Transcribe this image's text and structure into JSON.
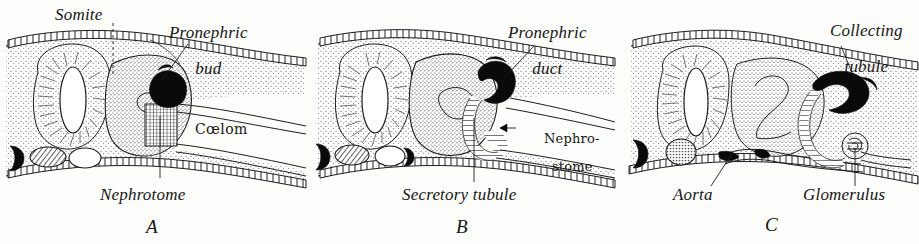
{
  "figure": {
    "background_color": "#fdfdfb",
    "ink_color": "#1a1a1a",
    "style": "engraved line drawing with stipple shading"
  },
  "panels": [
    {
      "plate": "A",
      "stage_name": "Pronephric bud stage",
      "labels": [
        {
          "id": "somite",
          "text": "Somite",
          "style": "italic",
          "lines": 1
        },
        {
          "id": "pronephric-bud",
          "text": "Pronephric",
          "text2": "bud",
          "style": "italic",
          "lines": 2
        },
        {
          "id": "coelom",
          "text": "Cœlom",
          "style": "upright",
          "lines": 1
        },
        {
          "id": "nephrotome",
          "text": "Nephrotome",
          "style": "italic",
          "lines": 1
        }
      ]
    },
    {
      "plate": "B",
      "stage_name": "Pronephric duct and secretory tubule stage",
      "labels": [
        {
          "id": "pronephric-duct",
          "text": "Pronephric",
          "text2": "duct",
          "style": "italic",
          "lines": 2
        },
        {
          "id": "nephrostome",
          "text": "Nephro-",
          "text2": "stome",
          "style": "upright",
          "lines": 2
        },
        {
          "id": "secretory-tubule",
          "text": "Secretory tubule",
          "style": "italic",
          "lines": 1
        }
      ]
    },
    {
      "plate": "C",
      "stage_name": "Collecting tubule and glomerulus stage",
      "labels": [
        {
          "id": "collecting-tubule",
          "text": "Collecting",
          "text2": "tubule",
          "style": "italic",
          "lines": 2
        },
        {
          "id": "aorta",
          "text": "Aorta",
          "style": "italic",
          "lines": 1
        },
        {
          "id": "glomerulus",
          "text": "Glomerulus",
          "style": "italic",
          "lines": 1
        }
      ]
    }
  ],
  "structures": {
    "neural_tube": "neural-tube",
    "notochord": "notochord",
    "somite_mass": "somite-mass",
    "gut": "gut",
    "ectoderm": "ectoderm-epithelium",
    "coelom_cavity": "coelom-cavity",
    "pronephric_bud": "pronephric-bud-mass",
    "pronephric_duct": "pronephric-duct-mass",
    "collecting_tubule": "collecting-tubule-mass",
    "glomerulus": "glomerulus-coil",
    "aorta": "aorta-vessel"
  }
}
